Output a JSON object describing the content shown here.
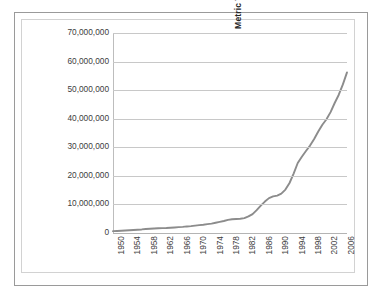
{
  "chart": {
    "type": "line",
    "ylabel": "Metric Tons of Aquaculture Production",
    "xlabel": "",
    "title": ""
  },
  "axes": {
    "y_ticks": [
      "70,000,000",
      "60,000,000",
      "50,000,000",
      "40,000,000",
      "30,000,000",
      "20,000,000",
      "10,000,000",
      "0"
    ],
    "x_ticks": [
      "1950",
      "1954",
      "1958",
      "1962",
      "1966",
      "1970",
      "1974",
      "1978",
      "1982",
      "1986",
      "1990",
      "1994",
      "1998",
      "2002",
      "2006"
    ]
  },
  "colors": {
    "series_line": "#8c8c8c",
    "gridline": "#c8c8c8",
    "axis_line": "#bdbdbd",
    "outer_frame": "#9a9a9a",
    "inner_frame": "#d2d2d2",
    "text": "#3d3d3d",
    "background": "#ffffff"
  },
  "chart_data": {
    "type": "line",
    "title": "",
    "xlabel": "",
    "ylabel": "Metric Tons of Aquaculture Production",
    "xlim": [
      1950,
      2007
    ],
    "ylim": [
      0,
      70000000
    ],
    "grid": true,
    "legend": false,
    "x_tick_step": 4,
    "y_tick_step": 10000000,
    "x": [
      1950,
      1951,
      1952,
      1953,
      1954,
      1955,
      1956,
      1957,
      1958,
      1959,
      1960,
      1961,
      1962,
      1963,
      1964,
      1965,
      1966,
      1967,
      1968,
      1969,
      1970,
      1971,
      1972,
      1973,
      1974,
      1975,
      1976,
      1977,
      1978,
      1979,
      1980,
      1981,
      1982,
      1983,
      1984,
      1985,
      1986,
      1987,
      1988,
      1989,
      1990,
      1991,
      1992,
      1993,
      1994,
      1995,
      1996,
      1997,
      1998,
      1999,
      2000,
      2001,
      2002,
      2003,
      2004,
      2005,
      2006,
      2007
    ],
    "series": [
      {
        "name": "Aquaculture production",
        "values": [
          640000,
          700000,
          780000,
          850000,
          950000,
          1050000,
          1150000,
          1250000,
          1400000,
          1500000,
          1600000,
          1650000,
          1700000,
          1750000,
          1850000,
          1950000,
          2050000,
          2150000,
          2300000,
          2400000,
          2600000,
          2750000,
          2900000,
          3100000,
          3300000,
          3600000,
          3900000,
          4200000,
          4600000,
          4800000,
          4900000,
          5000000,
          5200000,
          5800000,
          6600000,
          8000000,
          9600000,
          11000000,
          12200000,
          12800000,
          13100000,
          13800000,
          15200000,
          17500000,
          20800000,
          24500000,
          26700000,
          28700000,
          30600000,
          32900000,
          35500000,
          37900000,
          39800000,
          42300000,
          45500000,
          48400000,
          52000000,
          56200000
        ]
      }
    ]
  }
}
